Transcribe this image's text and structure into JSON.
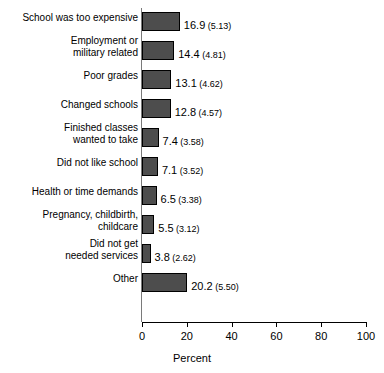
{
  "chart_data": {
    "type": "bar",
    "orientation": "horizontal",
    "title": "",
    "xlabel": "Percent",
    "ylabel": "",
    "xlim": [
      0,
      100
    ],
    "xticks": [
      "0",
      "20",
      "40",
      "60",
      "80",
      "100"
    ],
    "grid": false,
    "legend": null,
    "bar_color": "#4d4d4d",
    "bar_edge_color": "#000000",
    "categories": [
      "School was too expensive",
      "Employment or\nmilitary related",
      "Poor grades",
      "Changed schools",
      "Finished classes\nwanted to take",
      "Did not like school",
      "Health or time demands",
      "Pregnancy, childbirth,\nchildcare",
      "Did not get\nneeded services",
      "Other"
    ],
    "values": [
      16.9,
      14.4,
      13.1,
      12.8,
      7.4,
      7.1,
      6.5,
      5.5,
      3.8,
      20.2
    ],
    "standard_errors": [
      5.13,
      4.81,
      4.62,
      4.57,
      3.58,
      3.52,
      3.38,
      3.12,
      2.62,
      5.5
    ],
    "value_labels": [
      "16.9",
      "14.4",
      "13.1",
      "12.8",
      "7.4",
      "7.1",
      "6.5",
      "5.5",
      "3.8",
      "20.2"
    ],
    "se_labels": [
      "(5.13)",
      "(4.81)",
      "(4.62)",
      "(4.57)",
      "(3.58)",
      "(3.52)",
      "(3.38)",
      "(3.12)",
      "(2.62)",
      "(5.50)"
    ]
  }
}
